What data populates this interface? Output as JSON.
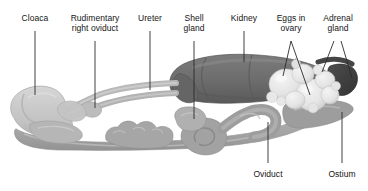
{
  "figure": {
    "background_color": "#ffffff",
    "leader_line_color": "#2b2b2b",
    "width": 368,
    "height": 191
  },
  "palette": {
    "cloaca_fill": "#c9c9c9",
    "cloaca_shade": "#b4b4b4",
    "cloaca_light": "#d8d8d8",
    "tube_fill": "#bdbdbd",
    "tube_shade": "#a8a8a8",
    "shell_gland_fill": "#b2b2b2",
    "kidney_fill": "#6f6f6f",
    "kidney_shade": "#5d5d5d",
    "kidney_light": "#8a8a8a",
    "adrenal_fill": "#3f3f3f",
    "egg_fill": "#ededed",
    "egg_shade": "#d5d5d5",
    "oviduct_fill": "#a9a9a9",
    "oviduct_shade": "#949494",
    "ostium_fill": "#9a9a9a",
    "outline": "#8c8c8c"
  },
  "labels": [
    {
      "id": "cloaca",
      "text": "Cloaca",
      "x": 35,
      "y": 14,
      "align": "center",
      "leader": true
    },
    {
      "id": "rudimentary-right-oviduct",
      "text": "Rudimentary\nright oviduct",
      "x": 95,
      "y": 14,
      "align": "center",
      "leader": true
    },
    {
      "id": "ureter",
      "text": "Ureter",
      "x": 150,
      "y": 14,
      "align": "center",
      "leader": true
    },
    {
      "id": "shell-gland",
      "text": "Shell\ngland",
      "x": 194,
      "y": 14,
      "align": "center",
      "leader": true
    },
    {
      "id": "kidney",
      "text": "Kidney",
      "x": 244,
      "y": 14,
      "align": "center",
      "leader": true
    },
    {
      "id": "eggs-in-ovary",
      "text": "Eggs in\novary",
      "x": 291,
      "y": 14,
      "align": "center",
      "leader": true
    },
    {
      "id": "adrenal-gland",
      "text": "Adrenal\ngland",
      "x": 338,
      "y": 14,
      "align": "center",
      "leader": true
    },
    {
      "id": "oviduct",
      "text": "Oviduct",
      "x": 268,
      "y": 170,
      "align": "center",
      "leader": true
    },
    {
      "id": "ostium",
      "text": "Ostium",
      "x": 342,
      "y": 170,
      "align": "center",
      "leader": true
    }
  ],
  "leader_lines": [
    {
      "id": "leader-cloaca",
      "points": "35,31 35,95"
    },
    {
      "id": "leader-rudimentary",
      "points": "95,41 95,108"
    },
    {
      "id": "leader-ureter",
      "points": "150,31 150,90"
    },
    {
      "id": "leader-shell-gland",
      "points": "194,41 194,119"
    },
    {
      "id": "leader-kidney",
      "points": "244,31 244,62"
    },
    {
      "id": "leader-eggs-a",
      "points": "291,41 283,76"
    },
    {
      "id": "leader-eggs-b",
      "points": "291,41 310,95"
    },
    {
      "id": "leader-adrenal-a",
      "points": "334,41 322,72"
    },
    {
      "id": "leader-adrenal-b",
      "points": "341,41 352,78"
    },
    {
      "id": "leader-oviduct",
      "points": "268,163 268,122"
    },
    {
      "id": "leader-ostium",
      "points": "342,163 342,112"
    }
  ]
}
